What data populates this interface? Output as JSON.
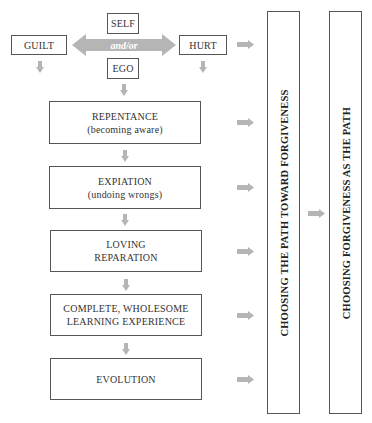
{
  "diagram": {
    "top": {
      "self": "SELF",
      "ego": "EGO",
      "guilt": "GUILT",
      "hurt": "HURT",
      "connector": "and/or"
    },
    "steps": [
      {
        "line1": "REPENTANCE",
        "line2": "(becoming aware)"
      },
      {
        "line1": "EXPIATION",
        "line2": "(undoing wrongs)"
      },
      {
        "line1": "LOVING",
        "line2": "REPARATION"
      },
      {
        "line1": "COMPLETE, WHOLESOME",
        "line2": "LEARNING EXPERIENCE"
      },
      {
        "line1": "EVOLUTION",
        "line2": ""
      }
    ],
    "columns": [
      {
        "label": "CHOOSING THE PATH TOWARD FORGIVENESS"
      },
      {
        "label": "CHOOSING FORGIVENESS AS THE PATH"
      }
    ],
    "colors": {
      "arrow": "#b5b5b5",
      "border": "#555555",
      "text": "#333333"
    }
  }
}
